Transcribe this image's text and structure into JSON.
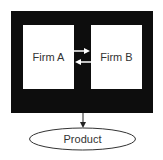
{
  "diagram": {
    "firm_a": {
      "label": "Firm A"
    },
    "firm_b": {
      "label": "Firm B"
    },
    "product": {
      "label": "Product"
    },
    "edges": [
      {
        "from": "Firm A",
        "to": "Firm B"
      },
      {
        "from": "Firm B",
        "to": "Firm A"
      },
      {
        "from": "Enclosure",
        "to": "Product"
      }
    ],
    "colors": {
      "enclosure": "#0d0d0d",
      "box_fill": "#ffffff",
      "text": "#333333"
    }
  }
}
